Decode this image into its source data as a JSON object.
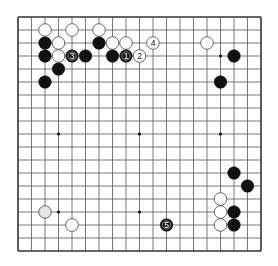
{
  "board": {
    "size": 19,
    "origin_x": 18,
    "origin_y": 17,
    "spacing_x": 13.5,
    "spacing_y": 13.0,
    "stone_radius": 6.3,
    "line_color": "#555555",
    "border_color": "#333333",
    "background": "#ffffff",
    "star_points": [
      [
        3,
        3
      ],
      [
        9,
        3
      ],
      [
        15,
        3
      ],
      [
        3,
        9
      ],
      [
        9,
        9
      ],
      [
        15,
        9
      ],
      [
        3,
        15
      ],
      [
        9,
        15
      ],
      [
        15,
        15
      ]
    ],
    "colors": {
      "black": "#111111",
      "white": "#ffffff",
      "white_outline": "#444444",
      "faded_white": "#e4e4e4"
    }
  },
  "stones": [
    {
      "color": "black",
      "col": 2,
      "row": 2
    },
    {
      "color": "black",
      "col": 6,
      "row": 2
    },
    {
      "color": "black",
      "col": 2,
      "row": 3
    },
    {
      "color": "black",
      "col": 4,
      "row": 3,
      "label": "3"
    },
    {
      "color": "black",
      "col": 5,
      "row": 3
    },
    {
      "color": "black",
      "col": 7,
      "row": 3
    },
    {
      "color": "black",
      "col": 8,
      "row": 3,
      "label": "1"
    },
    {
      "color": "black",
      "col": 3,
      "row": 4
    },
    {
      "color": "black",
      "col": 2,
      "row": 5
    },
    {
      "color": "black",
      "col": 16,
      "row": 3
    },
    {
      "color": "black",
      "col": 15,
      "row": 5
    },
    {
      "color": "black",
      "col": 16,
      "row": 12
    },
    {
      "color": "black",
      "col": 17,
      "row": 13
    },
    {
      "color": "black",
      "col": 16,
      "row": 15
    },
    {
      "color": "black",
      "col": 16,
      "row": 16
    },
    {
      "color": "black",
      "col": 11,
      "row": 16,
      "label": "5"
    },
    {
      "color": "white",
      "col": 2,
      "row": 1
    },
    {
      "color": "white",
      "col": 4,
      "row": 1
    },
    {
      "color": "white",
      "col": 6,
      "row": 1
    },
    {
      "color": "white",
      "col": 3,
      "row": 2
    },
    {
      "color": "white",
      "col": 7,
      "row": 2
    },
    {
      "color": "white",
      "col": 8,
      "row": 2
    },
    {
      "color": "white",
      "col": 10,
      "row": 2,
      "label": "4"
    },
    {
      "color": "white",
      "col": 14,
      "row": 2
    },
    {
      "color": "white",
      "col": 3,
      "row": 3
    },
    {
      "color": "white",
      "col": 9,
      "row": 3,
      "label": "2"
    },
    {
      "color": "white",
      "col": 15,
      "row": 14
    },
    {
      "color": "white",
      "col": 15,
      "row": 15
    },
    {
      "color": "white",
      "col": 15,
      "row": 16
    },
    {
      "color": "white",
      "col": 2,
      "row": 15,
      "faded": true
    },
    {
      "color": "white",
      "col": 4,
      "row": 16
    }
  ]
}
